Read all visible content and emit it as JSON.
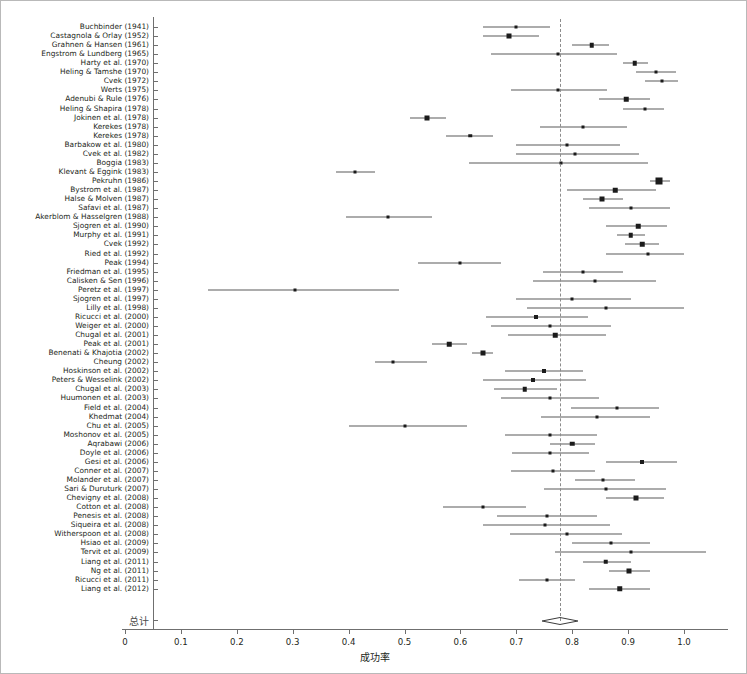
{
  "figure": {
    "type": "forest-plot",
    "axis_title": "成功率",
    "summary_label": "总计"
  },
  "chart_data": {
    "type": "scatter",
    "title": "",
    "xlabel": "成功率",
    "ylabel": "",
    "xlim": [
      0.0,
      1.08
    ],
    "ylim": [
      0,
      69
    ],
    "grid": false,
    "legend": null,
    "reference_line": 0.778,
    "x_ticks": [
      "0",
      "0.1",
      "0.2",
      "0.3",
      "0.4",
      "0.5",
      "0.6",
      "0.7",
      "0.8",
      "0.9",
      "1.0"
    ],
    "x_tick_values": [
      0.0,
      0.1,
      0.2,
      0.3,
      0.4,
      0.5,
      0.6,
      0.7,
      0.8,
      0.9,
      1.0
    ],
    "categories": [
      "Buchbinder (1941)",
      "Castagnola & Orlay (1952)",
      "Grahnen & Hansen (1961)",
      "Engstrom & Lundberg (1965)",
      "Harty et al. (1970)",
      "Heling & Tamshe (1970)",
      "Cvek (1972)",
      "Werts (1975)",
      "Adenubi & Rule (1976)",
      "Heling & Shapira (1978)",
      "Jokinen et al. (1978)",
      "Kerekes (1978)",
      "Kerekes (1978)",
      "Barbakow et al. (1980)",
      "Cvek et al. (1982)",
      "Boggia (1983)",
      "Klevant & Eggink (1983)",
      "Pekruhn (1986)",
      "Bystrom et al. (1987)",
      "Halse & Molven (1987)",
      "Safavi et al. (1987)",
      "Akerblom & Hasselgren (1988)",
      "Sjogren et al. (1990)",
      "Murphy et al. (1991)",
      "Cvek (1992)",
      "Ried et al. (1992)",
      "Peak (1994)",
      "Friedman et al. (1995)",
      "Calisken & Sen (1996)",
      "Peretz et al. (1997)",
      "Sjogren et al. (1997)",
      "Lilly et al. (1998)",
      "Ricucci et al. (2000)",
      "Weiger et al. (2000)",
      "Chugal et al. (2001)",
      "Peak et al. (2001)",
      "Benenati & Khajotia (2002)",
      "Cheung (2002)",
      "Hoskinson et al. (2002)",
      "Peters & Wesselink (2002)",
      "Chugal et al. (2003)",
      "Huumonen et al. (2003)",
      "Field et al. (2004)",
      "Khedmat (2004)",
      "Chu et al. (2005)",
      "Moshonov et al. (2005)",
      "Aqrabawi (2006)",
      "Doyle et al. (2006)",
      "Gesi et al. (2006)",
      "Conner et al. (2007)",
      "Molander et al. (2007)",
      "Sari & Duruturk (2007)",
      "Chevigny et al. (2008)",
      "Cotton et al. (2008)",
      "Penesis et al. (2008)",
      "Siqueira et al. (2008)",
      "Witherspoon et al. (2008)",
      "Hsiao et al. (2009)",
      "Tervit et al. (2009)",
      "Liang et al. (2011)",
      "Ng et al. (2011)",
      "Ricucci et al. (2011)",
      "Liang et al. (2012)"
    ],
    "estimates": [
      0.7,
      0.687,
      0.835,
      0.775,
      0.912,
      0.95,
      0.96,
      0.775,
      0.897,
      0.93,
      0.54,
      0.82,
      0.618,
      0.79,
      0.805,
      0.78,
      0.412,
      0.955,
      0.877,
      0.853,
      0.905,
      0.47,
      0.918,
      0.905,
      0.925,
      0.935,
      0.6,
      0.82,
      0.84,
      0.305,
      0.8,
      0.86,
      0.735,
      0.76,
      0.77,
      0.58,
      0.64,
      0.48,
      0.75,
      0.73,
      0.715,
      0.76,
      0.88,
      0.845,
      0.5,
      0.76,
      0.8,
      0.76,
      0.925,
      0.765,
      0.855,
      0.86,
      0.915,
      0.64,
      0.755,
      0.752,
      0.79,
      0.87,
      0.905,
      0.86,
      0.902,
      0.755,
      0.885
    ],
    "ci_low": [
      0.64,
      0.64,
      0.8,
      0.655,
      0.89,
      0.915,
      0.93,
      0.69,
      0.848,
      0.89,
      0.51,
      0.742,
      0.575,
      0.7,
      0.7,
      0.615,
      0.378,
      0.94,
      0.79,
      0.82,
      0.83,
      0.395,
      0.86,
      0.88,
      0.895,
      0.86,
      0.525,
      0.748,
      0.73,
      0.148,
      0.7,
      0.72,
      0.645,
      0.655,
      0.685,
      0.55,
      0.62,
      0.448,
      0.68,
      0.64,
      0.66,
      0.673,
      0.798,
      0.745,
      0.4,
      0.68,
      0.76,
      0.693,
      0.86,
      0.69,
      0.805,
      0.75,
      0.86,
      0.568,
      0.665,
      0.64,
      0.688,
      0.8,
      0.77,
      0.82,
      0.865,
      0.705,
      0.83
    ],
    "ci_high": [
      0.76,
      0.74,
      0.865,
      0.88,
      0.935,
      0.985,
      0.99,
      0.862,
      0.94,
      0.965,
      0.575,
      0.898,
      0.658,
      0.885,
      0.92,
      0.935,
      0.448,
      0.975,
      0.95,
      0.89,
      0.975,
      0.55,
      0.97,
      0.93,
      0.955,
      1.0,
      0.672,
      0.89,
      0.95,
      0.49,
      0.905,
      1.0,
      0.828,
      0.87,
      0.86,
      0.612,
      0.658,
      0.54,
      0.82,
      0.825,
      0.772,
      0.848,
      0.955,
      0.94,
      0.612,
      0.845,
      0.84,
      0.83,
      0.988,
      0.84,
      0.912,
      0.968,
      0.965,
      0.718,
      0.845,
      0.868,
      0.89,
      0.94,
      1.04,
      0.905,
      0.94,
      0.805,
      0.94
    ],
    "marker_sizes": [
      3.0,
      5.0,
      4.5,
      3.0,
      4.5,
      3.0,
      3.0,
      3.0,
      4.5,
      3.0,
      5.0,
      3.0,
      3.5,
      3.0,
      3.0,
      3.0,
      3.0,
      7.0,
      4.5,
      5.0,
      3.0,
      3.0,
      4.5,
      4.5,
      4.5,
      3.0,
      3.0,
      3.0,
      3.0,
      3.0,
      3.0,
      3.0,
      4.0,
      3.0,
      4.5,
      4.5,
      5.0,
      3.0,
      4.0,
      4.0,
      4.5,
      3.0,
      3.0,
      3.0,
      3.0,
      3.0,
      4.5,
      3.0,
      4.0,
      3.0,
      3.0,
      3.0,
      5.0,
      3.0,
      3.0,
      3.0,
      3.0,
      3.0,
      3.0,
      4.5,
      5.0,
      3.0,
      5.5
    ],
    "summary": {
      "label": "总计",
      "estimate": 0.778,
      "ci_low": 0.737,
      "ci_high": 0.801
    }
  },
  "colors": {
    "marker": "#1b1b1b",
    "ci_line": "#5a5a5a",
    "axis": "#6f6f6f",
    "reference_line": "#8c8c8c",
    "text": "#231f20",
    "background": "#ffffff",
    "frame": "#b9b9b9"
  }
}
